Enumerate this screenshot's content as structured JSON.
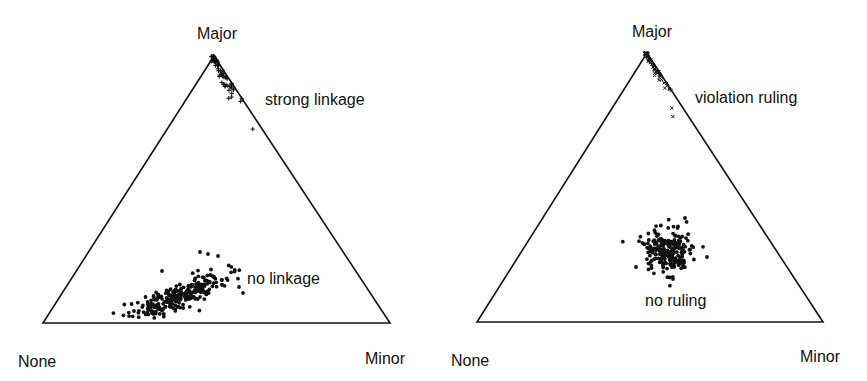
{
  "chart_data": [
    {
      "type": "scatter",
      "subtype": "ternary",
      "title": "",
      "vertices": {
        "top": "Major",
        "bottom_left": "None",
        "bottom_right": "Minor"
      },
      "annotations": [
        "strong linkage",
        "no linkage"
      ],
      "series": [
        {
          "name": "strong linkage",
          "marker": "+",
          "description": "points concentrated along Major–Minor edge near Major vertex",
          "approx_center": {
            "Major": 0.92,
            "None": 0.0,
            "Minor": 0.08
          }
        },
        {
          "name": "no linkage",
          "marker": "dot",
          "description": "elongated cloud near the base, skewed toward None",
          "approx_center": {
            "Major": 0.12,
            "None": 0.55,
            "Minor": 0.33
          }
        }
      ],
      "grid": false,
      "legend": "none (inline labels)"
    },
    {
      "type": "scatter",
      "subtype": "ternary",
      "title": "",
      "vertices": {
        "top": "Major",
        "bottom_left": "None",
        "bottom_right": "Minor"
      },
      "annotations": [
        "violation ruling",
        "no ruling"
      ],
      "series": [
        {
          "name": "violation ruling",
          "marker": "x",
          "description": "points concentrated along Major–Minor edge near Major vertex",
          "approx_center": {
            "Major": 0.9,
            "None": 0.0,
            "Minor": 0.1
          }
        },
        {
          "name": "no ruling",
          "marker": "dot",
          "description": "roughly circular cloud in lower-middle of triangle",
          "approx_center": {
            "Major": 0.26,
            "None": 0.37,
            "Minor": 0.37
          }
        }
      ],
      "grid": false,
      "legend": "none (inline labels)"
    }
  ],
  "left_panel": {
    "vertex_top": "Major",
    "vertex_left": "None",
    "vertex_right": "Minor",
    "label_upper": "strong linkage",
    "label_lower": "no linkage"
  },
  "right_panel": {
    "vertex_top": "Major",
    "vertex_left": "None",
    "vertex_right": "Minor",
    "label_upper": "violation ruling",
    "label_lower": "no ruling"
  }
}
